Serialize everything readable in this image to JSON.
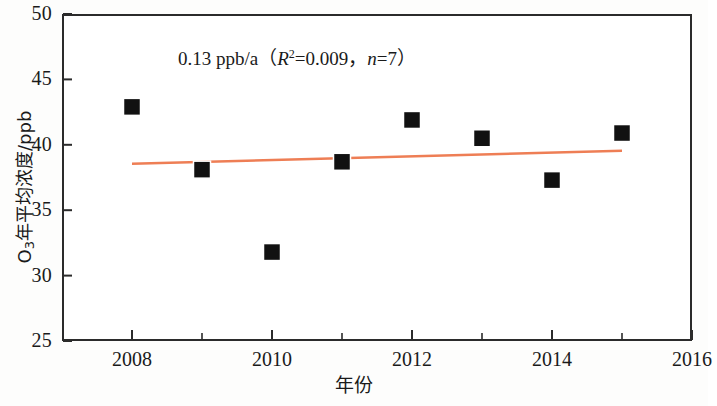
{
  "chart_data": {
    "type": "scatter",
    "title": "",
    "xlabel": "年份",
    "ylabel": "O3年平均浓度/ppb",
    "ylabel_parts": {
      "prefix": "O",
      "sub": "3",
      "suffix": "年平均浓度/ppb"
    },
    "x": [
      2008,
      2009,
      2010,
      2011,
      2012,
      2013,
      2014,
      2015
    ],
    "values": [
      42.9,
      38.1,
      31.8,
      38.7,
      41.9,
      40.5,
      37.3,
      40.9
    ],
    "series": [
      {
        "name": "O3年平均浓度",
        "values": [
          42.9,
          38.1,
          31.8,
          38.7,
          41.9,
          40.5,
          37.3,
          40.9
        ],
        "marker": "square",
        "color": "#111111"
      }
    ],
    "trendline": {
      "x_start": 2008,
      "x_end": 2015,
      "y_start": 38.55,
      "y_end": 39.55,
      "slope_label": "0.13 ppb/a",
      "color": "#EE7E55"
    },
    "annotation": {
      "full": "0.13 ppb/a（R2=0.009，n=7）",
      "slope": "0.13 ppb/a",
      "open_paren": "（",
      "r_symbol": "R",
      "r_exponent": "2",
      "r_value": "=0.009",
      "comma": "，",
      "n_symbol": "n",
      "n_value": "=7",
      "close_paren": "）"
    },
    "xlim": [
      2007,
      2016
    ],
    "ylim": [
      25,
      50
    ],
    "xticks": [
      2008,
      2010,
      2012,
      2014,
      2016
    ],
    "xtick_labels": [
      "2008",
      "2010",
      "2012",
      "2014",
      "2016"
    ],
    "xminor_ticks": [
      2009,
      2011,
      2013,
      2015
    ],
    "yticks": [
      25,
      30,
      35,
      40,
      45,
      50
    ],
    "ytick_labels": [
      "25",
      "30",
      "35",
      "40",
      "45",
      "50"
    ],
    "grid": false,
    "legend": null,
    "frame_color": "#2b2b2b"
  }
}
